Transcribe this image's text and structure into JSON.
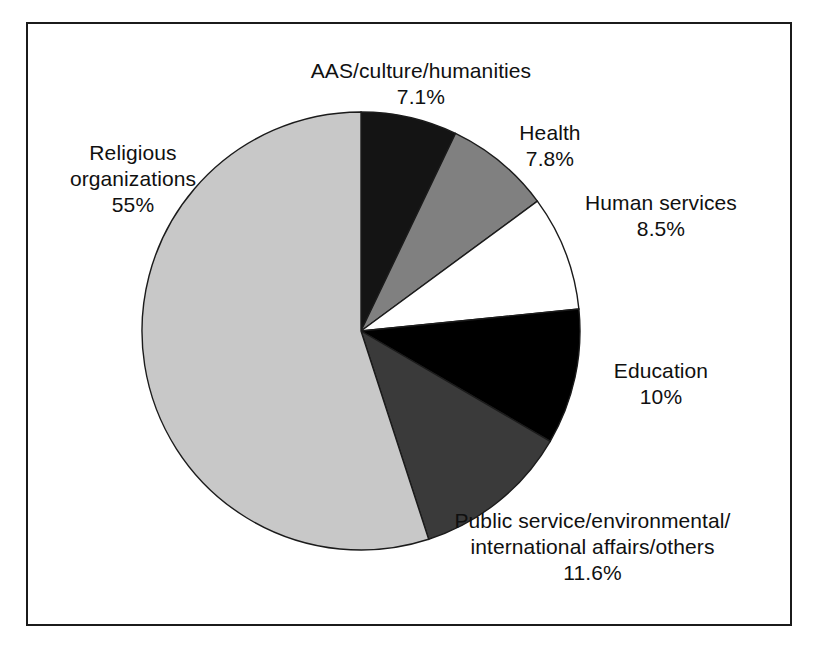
{
  "figure": {
    "background": "#ffffff",
    "frame_color": "#1b1b1b"
  },
  "chart_data": {
    "type": "pie",
    "title": "",
    "subtitle": "",
    "xlabel": "",
    "ylabel": "",
    "legend_position": "none",
    "grid": false,
    "label_format": "name + percent",
    "start_angle_deg": 0,
    "direction": "clockwise",
    "categories": [
      "AAS/culture/humanities",
      "Health",
      "Human services",
      "Education",
      "Public service/environmental/ international affairs/others",
      "Religious organizations"
    ],
    "values": [
      7.1,
      7.8,
      8.5,
      10,
      11.6,
      55
    ],
    "value_labels": [
      "7.1%",
      "7.8%",
      "8.5%",
      "10%",
      "11.6%",
      "55%"
    ],
    "colors": [
      "#141414",
      "#808080",
      "#ffffff",
      "#000000",
      "#3a3a3a",
      "#c8c8c8"
    ],
    "slices": [
      {
        "name": "AAS/culture/humanities",
        "value": 7.1,
        "value_label": "7.1%",
        "color": "#141414",
        "label_line1": "AAS/culture/humanities",
        "label_line2": "",
        "label_line3": ""
      },
      {
        "name": "Health",
        "value": 7.8,
        "value_label": "7.8%",
        "color": "#808080",
        "label_line1": "Health",
        "label_line2": "",
        "label_line3": ""
      },
      {
        "name": "Human services",
        "value": 8.5,
        "value_label": "8.5%",
        "color": "#ffffff",
        "label_line1": "Human services",
        "label_line2": "",
        "label_line3": ""
      },
      {
        "name": "Education",
        "value": 10,
        "value_label": "10%",
        "color": "#000000",
        "label_line1": "Education",
        "label_line2": "",
        "label_line3": ""
      },
      {
        "name": "Public service/environmental/ international affairs/others",
        "value": 11.6,
        "value_label": "11.6%",
        "color": "#3a3a3a",
        "label_line1": "Public service/environmental/",
        "label_line2": "international affairs/others",
        "label_line3": ""
      },
      {
        "name": "Religious organizations",
        "value": 55,
        "value_label": "55%",
        "color": "#c8c8c8",
        "label_line1": "Religious",
        "label_line2": "organizations",
        "label_line3": ""
      }
    ]
  }
}
